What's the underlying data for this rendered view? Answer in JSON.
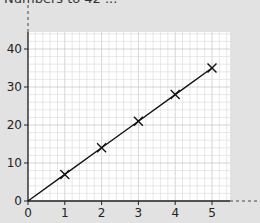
{
  "header": {
    "title": "Numbers to 42  ..."
  },
  "chart_data": {
    "type": "line",
    "title": "",
    "xlabel": "",
    "ylabel": "",
    "x": [
      0,
      1,
      2,
      3,
      4,
      5
    ],
    "series": [
      {
        "name": "line",
        "values": [
          0,
          7,
          14,
          21,
          28,
          35
        ],
        "markers": "x",
        "marker_at": [
          1,
          2,
          3,
          4,
          5
        ]
      }
    ],
    "x_ticks": [
      "0",
      "1",
      "2",
      "3",
      "4",
      "5"
    ],
    "y_ticks": [
      "0",
      "10",
      "20",
      "30",
      "40"
    ],
    "xlim": [
      0,
      5.5
    ],
    "ylim": [
      0,
      44
    ],
    "grid": true,
    "grid_style": "graph paper (minor 1/5 units)",
    "legend": "none",
    "colors": {
      "line": "#111111",
      "grid_minor": "#d8d8d8",
      "grid_major": "#b8b8b8",
      "paper": "#ffffff",
      "background": "#e2e2e2"
    }
  }
}
